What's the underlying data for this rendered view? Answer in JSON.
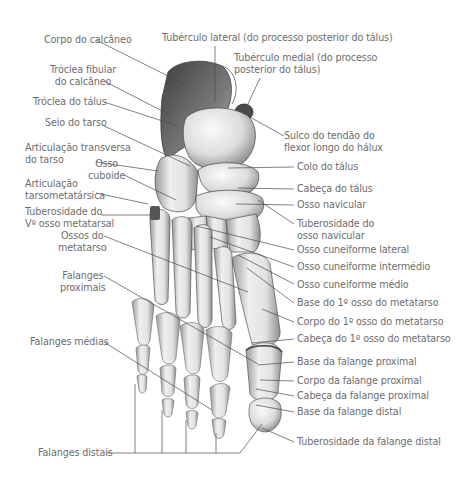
{
  "diagram": {
    "type": "anatomical-illustration",
    "leader_color": "#4a4a4a",
    "text_color": "#6d6d6d",
    "bone_colors": {
      "light": "#f2f2f2",
      "mid": "#c8c8c8",
      "dark": "#5a5a5a"
    }
  },
  "labels_left": [
    {
      "id": "corpo-calcaneo",
      "lines": [
        "Corpo do calcâneo"
      ]
    },
    {
      "id": "troclea-fibular",
      "lines": [
        "Tróclea fibular",
        "do calcâneo"
      ]
    },
    {
      "id": "troclea-talus",
      "lines": [
        "Tróclea do tálus"
      ]
    },
    {
      "id": "seio-tarso",
      "lines": [
        "Seio do tarso"
      ]
    },
    {
      "id": "articulacao-transversa",
      "lines": [
        "Articulação transversa",
        "do tarso"
      ]
    },
    {
      "id": "osso-cuboide",
      "lines": [
        "Osso",
        "cuboide"
      ]
    },
    {
      "id": "articulacao-tarsometatarsica",
      "lines": [
        "Articulação",
        "tarsometatársica"
      ]
    },
    {
      "id": "tuberosidade-v-metatarsal",
      "lines": [
        "Tuberosidade do",
        "Vº osso metatarsal"
      ]
    },
    {
      "id": "ossos-metatarso",
      "lines": [
        "Ossos do",
        "metatarso"
      ]
    },
    {
      "id": "falanges-proximais",
      "lines": [
        "Falanges",
        "proximais"
      ]
    },
    {
      "id": "falanges-medias",
      "lines": [
        "Falanges médias"
      ]
    },
    {
      "id": "falanges-distais",
      "lines": [
        "Falanges distais"
      ]
    }
  ],
  "labels_top": [
    {
      "id": "tuberculo-lateral",
      "lines": [
        "Tubérculo lateral (do processo posterior do tálus)"
      ]
    },
    {
      "id": "tuberculo-medial",
      "lines": [
        "Tubérculo medial (do processo",
        "posterior do tálus)"
      ]
    }
  ],
  "labels_right": [
    {
      "id": "sulco-tendao",
      "lines": [
        "Sulco do tendão do",
        "flexor longo do hálux"
      ]
    },
    {
      "id": "colo-talus",
      "lines": [
        "Colo do tálus"
      ]
    },
    {
      "id": "cabeca-talus",
      "lines": [
        "Cabeça do tálus"
      ]
    },
    {
      "id": "osso-navicular",
      "lines": [
        "Osso navicular"
      ]
    },
    {
      "id": "tuberosidade-navicular",
      "lines": [
        "Tuberosidade do",
        "osso navicular"
      ]
    },
    {
      "id": "cuneiforme-lateral",
      "lines": [
        "Osso cuneiforme lateral"
      ]
    },
    {
      "id": "cuneiforme-intermedio",
      "lines": [
        "Osso cuneiforme intermédio"
      ]
    },
    {
      "id": "cuneiforme-medio",
      "lines": [
        "Osso cuneiforme médio"
      ]
    },
    {
      "id": "base-1-metatarso",
      "lines": [
        "Base do 1º osso do metatarso"
      ]
    },
    {
      "id": "corpo-1-metatarso",
      "lines": [
        "Corpo do 1º osso do metatarso"
      ]
    },
    {
      "id": "cabeca-1-metatarso",
      "lines": [
        "Cabeça do 1º osso do metatarso"
      ]
    },
    {
      "id": "base-falange-proximal",
      "lines": [
        "Base da falange proximal"
      ]
    },
    {
      "id": "corpo-falange-proximal",
      "lines": [
        "Corpo da falange proximal"
      ]
    },
    {
      "id": "cabeca-falange-proximal",
      "lines": [
        "Cabeça da falange proximal"
      ]
    },
    {
      "id": "base-falange-distal",
      "lines": [
        "Base da falange distal"
      ]
    },
    {
      "id": "tuberosidade-falange-distal",
      "lines": [
        "Tuberosidade da falange distal"
      ]
    }
  ]
}
